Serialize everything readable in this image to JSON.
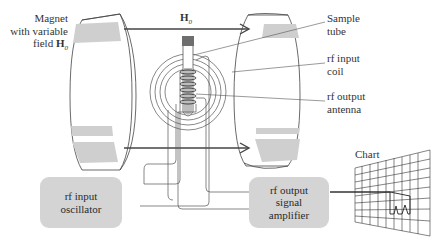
{
  "diagram": {
    "type": "NMR spectrometer schematic",
    "labels": {
      "magnet_line1": "Magnet",
      "magnet_line2": "with variable",
      "magnet_line3": "field",
      "magnet_field_symbol": "H",
      "magnet_field_subscript": "0",
      "field_symbol": "H",
      "field_subscript": "0",
      "sample_tube_line1": "Sample",
      "sample_tube_line2": "tube",
      "rf_input_coil_line1": "rf input",
      "rf_input_coil_line2": "coil",
      "rf_output_antenna_line1": "rf output",
      "rf_output_antenna_line2": "antenna",
      "chart": "Chart"
    },
    "boxes": {
      "oscillator_line1": "rf input",
      "oscillator_line2": "oscillator",
      "amplifier_line1": "rf output",
      "amplifier_line2": "signal",
      "amplifier_line3": "amplifier"
    },
    "colors": {
      "line": "#444444",
      "magnet_band": "#cfcfcf",
      "box_fill": "#d4d4d4",
      "tube_cap": "#6e6e6e",
      "sample": "#bdbdbd"
    }
  }
}
